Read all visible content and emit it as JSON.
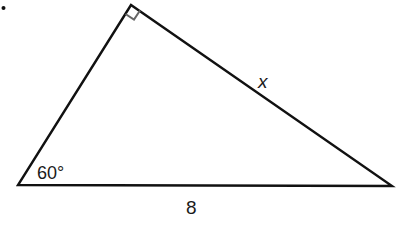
{
  "diagram": {
    "type": "right-triangle",
    "vertices": {
      "top": {
        "x": 131,
        "y": 5,
        "angle": "90°",
        "right_angle_marker": true
      },
      "left": {
        "x": 18,
        "y": 185,
        "angle": "60°"
      },
      "right": {
        "x": 392,
        "y": 186
      }
    },
    "labels": {
      "angle_left": "60°",
      "hypotenuse": "8",
      "side_x": "x"
    },
    "stroke_color": "#111111",
    "marker_color": "#666666",
    "bullet": "•"
  }
}
